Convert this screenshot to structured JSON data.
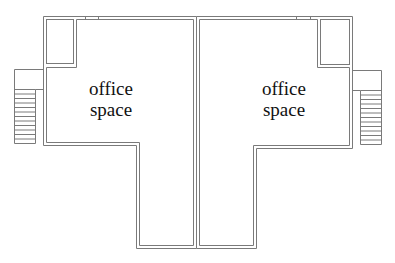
{
  "diagram": {
    "type": "floor-plan",
    "line_color": "#7a7a7a",
    "background": "#ffffff",
    "units": [
      {
        "id": "left-unit",
        "label_line1": "office",
        "label_line2": "space",
        "features": [
          "closet",
          "exterior-stair"
        ]
      },
      {
        "id": "right-unit",
        "label_line1": "office",
        "label_line2": "space",
        "features": [
          "closet",
          "exterior-stair"
        ]
      }
    ],
    "stairs": {
      "left_step_count": 12,
      "right_step_count": 12
    }
  }
}
